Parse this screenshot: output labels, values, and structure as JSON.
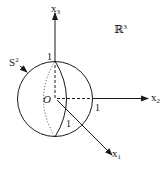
{
  "diagram": {
    "space_label": "ℝ",
    "space_exp": "3",
    "sphere_label": "S",
    "sphere_exp": "2",
    "origin_label": "O",
    "axes": {
      "x1": {
        "name": "x",
        "sub": "1"
      },
      "x2": {
        "name": "x",
        "sub": "2"
      },
      "x3": {
        "name": "x",
        "sub": "3"
      }
    },
    "unit_labels": {
      "x3_unit": "1",
      "x2_unit": "1",
      "x1_unit": "1"
    },
    "colors": {
      "stroke": "#1a1a1a",
      "background": "#ffffff"
    }
  }
}
